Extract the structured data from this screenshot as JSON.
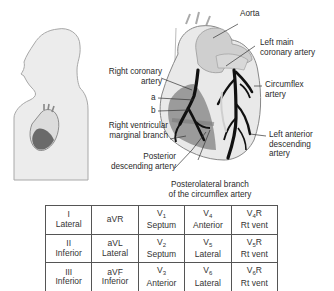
{
  "labels": {
    "aorta": "Aorta",
    "left_main_1": "Left main",
    "left_main_2": "coronary artery",
    "circumflex_1": "Circumflex",
    "circumflex_2": "artery",
    "rca_1": "Right coronary",
    "rca_2": "artery",
    "a": "a",
    "b": "b",
    "rv_marginal_1": "Right ventricular",
    "rv_marginal_2": "marginal branch",
    "lad_1": "Left anterior",
    "lad_2": "descending",
    "lad_3": "artery",
    "pda_1": "Posterior",
    "pda_2": "descending artery",
    "posterolateral_1": "Posterolateral branch",
    "posterolateral_2": "of the circumflex artery"
  },
  "colors": {
    "heart_light": "#e6e6e6",
    "heart_mid": "#c8c8c8",
    "heart_dark": "#7a7a7a",
    "artery": "#111111",
    "outline": "#9a9a9a"
  },
  "lead_table": {
    "rows": [
      [
        {
          "lead": "I",
          "sub": "",
          "suffix": "",
          "region": "Lateral"
        },
        {
          "lead": "aVR",
          "sub": "",
          "suffix": "",
          "region": ""
        },
        {
          "lead": "V",
          "sub": "1",
          "suffix": "",
          "region": "Septum"
        },
        {
          "lead": "V",
          "sub": "4",
          "suffix": "",
          "region": "Anterior"
        },
        {
          "lead": "V",
          "sub": "4",
          "suffix": "R",
          "region": "Rt vent"
        }
      ],
      [
        {
          "lead": "II",
          "sub": "",
          "suffix": "",
          "region": "Inferior"
        },
        {
          "lead": "aVL",
          "sub": "",
          "suffix": "",
          "region": "Lateral"
        },
        {
          "lead": "V",
          "sub": "2",
          "suffix": "",
          "region": "Septum"
        },
        {
          "lead": "V",
          "sub": "5",
          "suffix": "",
          "region": "Lateral"
        },
        {
          "lead": "V",
          "sub": "5",
          "suffix": "R",
          "region": "Rt vent"
        }
      ],
      [
        {
          "lead": "III",
          "sub": "",
          "suffix": "",
          "region": "Inferior"
        },
        {
          "lead": "aVF",
          "sub": "",
          "suffix": "",
          "region": "Inferior"
        },
        {
          "lead": "V",
          "sub": "3",
          "suffix": "",
          "region": "Anterior"
        },
        {
          "lead": "V",
          "sub": "6",
          "suffix": "",
          "region": "Lateral"
        },
        {
          "lead": "V",
          "sub": "6",
          "suffix": "R",
          "region": "Rt vent"
        }
      ]
    ]
  }
}
